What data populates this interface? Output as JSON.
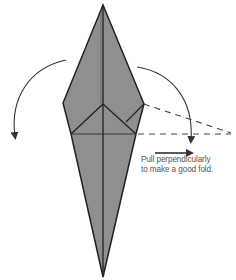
{
  "diagram": {
    "type": "origami-fold-step",
    "caption_line1": "Pull perpendicularly",
    "caption_line2": "to make a good fold.",
    "colors": {
      "paper_fill": "#8f8f8f",
      "outline": "#222222",
      "arrow": "#333333",
      "dash": "#444444",
      "caption": "#555555"
    },
    "elements": [
      "kite-shaped folded paper",
      "left curved fold arrow",
      "right curved fold arrow",
      "dashed projection lines",
      "pull direction arrow"
    ]
  }
}
